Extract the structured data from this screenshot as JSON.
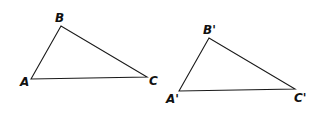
{
  "diagram": {
    "triangles": [
      {
        "name": "ABC",
        "vertices": [
          {
            "label": "A",
            "x": 31,
            "y": 79,
            "lx": 20,
            "ly": 86
          },
          {
            "label": "B",
            "x": 61,
            "y": 26,
            "lx": 55,
            "ly": 22
          },
          {
            "label": "C",
            "x": 147,
            "y": 77,
            "lx": 149,
            "ly": 85
          }
        ]
      },
      {
        "name": "A'B'C'",
        "vertices": [
          {
            "label": "A'",
            "x": 179,
            "y": 91,
            "lx": 166,
            "ly": 103
          },
          {
            "label": "B'",
            "x": 209,
            "y": 38,
            "lx": 203,
            "ly": 34
          },
          {
            "label": "C'",
            "x": 295,
            "y": 89,
            "lx": 294,
            "ly": 102
          }
        ]
      }
    ],
    "colors": {
      "stroke": "#1a1a1a",
      "label": "#111111",
      "background": "#ffffff"
    }
  }
}
